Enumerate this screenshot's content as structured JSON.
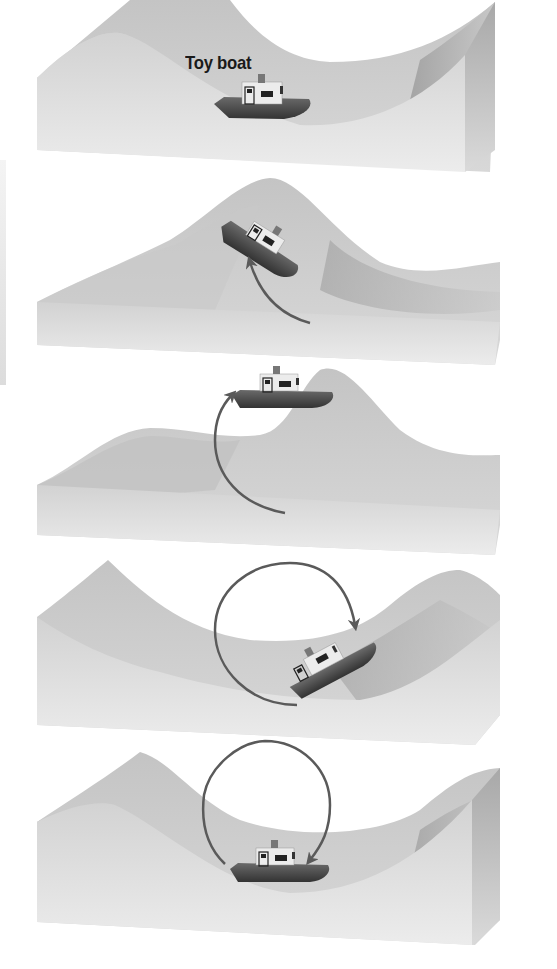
{
  "figure": {
    "label_toy_boat": "Toy boat",
    "colors": {
      "background": "#ffffff",
      "water_top": "#cfcfcf",
      "water_shadow": "#8e8e8e",
      "water_front": "#e6e6e6",
      "boat_hull": "#4a4a4a",
      "boat_cabin": "#eeeeee",
      "arrow": "#5a5a5a"
    },
    "panels": [
      {
        "index": 1,
        "boat_position": "trough",
        "arrow": "none",
        "label": "Toy boat"
      },
      {
        "index": 2,
        "boat_position": "rising front of crest",
        "arrow": "quarter arc, up-left"
      },
      {
        "index": 3,
        "boat_position": "crest",
        "arrow": "half arc, up"
      },
      {
        "index": 4,
        "boat_position": "descending back slope",
        "arrow": "three-quarter circle, clockwise"
      },
      {
        "index": 5,
        "boat_position": "trough",
        "arrow": "full circle, clockwise"
      }
    ]
  }
}
